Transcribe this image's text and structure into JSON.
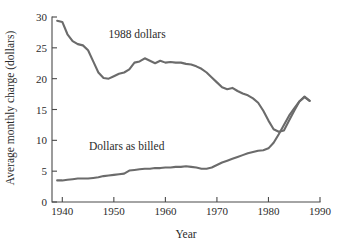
{
  "chart_data": {
    "type": "line",
    "title": "",
    "xlabel": "Year",
    "ylabel": "Average monthly charge (dollars)",
    "xlim": [
      1938,
      1990
    ],
    "ylim": [
      0,
      30
    ],
    "xticks": [
      1940,
      1950,
      1960,
      1970,
      1980,
      1990
    ],
    "xtick_labels": [
      "1940",
      "1950",
      "1960",
      "1970",
      "1980",
      "1990"
    ],
    "yticks": [
      0,
      5,
      10,
      15,
      20,
      25,
      30
    ],
    "ytick_labels": [
      "0",
      "5",
      "10",
      "15",
      "20",
      "25",
      "30"
    ],
    "grid": false,
    "legend_position": "inline-annotations",
    "line_color": "#6b6b6b",
    "axis_color": "#4a4a4a",
    "text_color": "#2b2b2b",
    "background": "#ffffff",
    "annotations": [
      {
        "text": "1988 dollars",
        "x": 1954.5,
        "y": 26.6
      },
      {
        "text": "Dollars as billed",
        "x": 1952.5,
        "y": 8.4
      }
    ],
    "series": [
      {
        "name": "1988 dollars",
        "label": "1988 dollars",
        "x": [
          1939,
          1940,
          1941,
          1942,
          1943,
          1944,
          1945,
          1946,
          1947,
          1948,
          1949,
          1950,
          1951,
          1952,
          1953,
          1954,
          1955,
          1956,
          1957,
          1958,
          1959,
          1960,
          1961,
          1962,
          1963,
          1964,
          1965,
          1966,
          1967,
          1968,
          1969,
          1970,
          1971,
          1972,
          1973,
          1974,
          1975,
          1976,
          1977,
          1978,
          1979,
          1980,
          1981,
          1982,
          1983,
          1984,
          1985,
          1986,
          1987,
          1988
        ],
        "values": [
          29.4,
          29.2,
          27.2,
          26.1,
          25.6,
          25.4,
          24.6,
          22.8,
          21.0,
          20.1,
          20.0,
          20.4,
          20.8,
          21.0,
          21.5,
          22.6,
          22.8,
          23.3,
          22.9,
          22.5,
          22.9,
          22.6,
          22.7,
          22.6,
          22.6,
          22.4,
          22.3,
          22.0,
          21.6,
          21.0,
          20.2,
          19.4,
          18.6,
          18.3,
          18.5,
          18.0,
          17.6,
          17.3,
          16.8,
          16.1,
          14.8,
          13.2,
          11.8,
          11.4,
          11.6,
          13.2,
          14.8,
          16.3,
          17.1,
          16.4
        ]
      },
      {
        "name": "Dollars as billed",
        "label": "Dollars as billed",
        "x": [
          1939,
          1940,
          1941,
          1942,
          1943,
          1944,
          1945,
          1946,
          1947,
          1948,
          1949,
          1950,
          1951,
          1952,
          1953,
          1954,
          1955,
          1956,
          1957,
          1958,
          1959,
          1960,
          1961,
          1962,
          1963,
          1964,
          1965,
          1966,
          1967,
          1968,
          1969,
          1970,
          1971,
          1972,
          1973,
          1974,
          1975,
          1976,
          1977,
          1978,
          1979,
          1980,
          1981,
          1982,
          1983,
          1984,
          1985,
          1986,
          1987,
          1988
        ],
        "values": [
          3.5,
          3.5,
          3.6,
          3.7,
          3.8,
          3.8,
          3.8,
          3.9,
          4.0,
          4.2,
          4.3,
          4.4,
          4.5,
          4.6,
          5.1,
          5.2,
          5.3,
          5.4,
          5.4,
          5.5,
          5.5,
          5.6,
          5.6,
          5.7,
          5.7,
          5.8,
          5.7,
          5.6,
          5.4,
          5.4,
          5.6,
          6.0,
          6.4,
          6.7,
          7.0,
          7.3,
          7.6,
          7.9,
          8.1,
          8.3,
          8.4,
          8.7,
          9.6,
          11.0,
          12.5,
          14.0,
          15.2,
          16.3,
          17.0,
          16.4
        ]
      }
    ]
  }
}
